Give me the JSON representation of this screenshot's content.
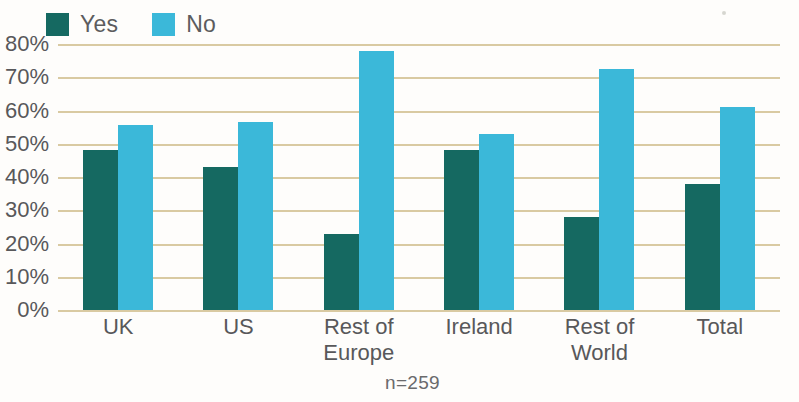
{
  "legend": {
    "entries": [
      {
        "label": "Yes",
        "color": "#156961",
        "icon": "square-swatch-icon"
      },
      {
        "label": "No",
        "color": "#3bb8d9",
        "icon": "square-swatch-icon"
      }
    ]
  },
  "footnote": "n=259",
  "colors": {
    "yes": "#156961",
    "no": "#3bb8d9",
    "gridline": "#d9caa2",
    "text": "#58585a",
    "background": "#fefdfb"
  },
  "chart_data": {
    "type": "bar",
    "title": "",
    "subtitle": "",
    "xlabel": "",
    "ylabel": "",
    "ylim": [
      0,
      80
    ],
    "yticks": [
      0,
      10,
      20,
      30,
      40,
      50,
      60,
      70,
      80
    ],
    "ytick_labels": [
      "0%",
      "10%",
      "20%",
      "30%",
      "40%",
      "50%",
      "60%",
      "70%",
      "80%"
    ],
    "grid": true,
    "legend_position": "top-left",
    "value_format": "percent",
    "categories": [
      "UK",
      "US",
      "Rest of\nEurope",
      "Ireland",
      "Rest of\nWorld",
      "Total"
    ],
    "series": [
      {
        "name": "Yes",
        "color": "#156961",
        "values": [
          48,
          43,
          23,
          48,
          28,
          38
        ]
      },
      {
        "name": "No",
        "color": "#3bb8d9",
        "values": [
          55.5,
          56.5,
          78,
          53,
          72.5,
          61
        ]
      }
    ],
    "annotations": [
      "n=259"
    ]
  }
}
